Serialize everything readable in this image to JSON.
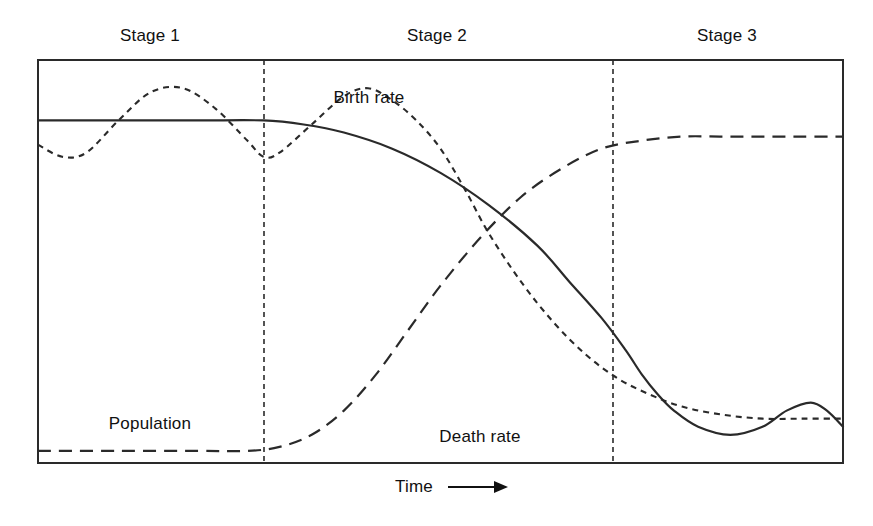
{
  "figure": {
    "background_color": "#ffffff",
    "line_color": "#2a2a2a"
  },
  "stages": [
    {
      "label": "Stage 1",
      "center_x": 150,
      "label_y": 26
    },
    {
      "label": "Stage 2",
      "center_x": 437,
      "label_y": 26
    },
    {
      "label": "Stage 3",
      "center_x": 727,
      "label_y": 26
    }
  ],
  "curve_labels": [
    {
      "name": "birth-rate",
      "label": "Birth rate",
      "x": 369,
      "y": 88
    },
    {
      "name": "population",
      "label": "Population",
      "x": 150,
      "y": 414
    },
    {
      "name": "death-rate",
      "label": "Death rate",
      "x": 480,
      "y": 427
    }
  ],
  "axis": {
    "x_label": "Time",
    "x_label_x": 444,
    "x_label_y": 477,
    "arrow_glyph": "arrow-right"
  },
  "chart_data": {
    "type": "line",
    "xlabel": "Time",
    "ylabel": "",
    "grid": false,
    "legend": "inline-annotations",
    "axis_ranges": {
      "x": [
        0,
        100
      ],
      "y": [
        0,
        100
      ]
    },
    "plot_box_px": {
      "left": 38,
      "top": 60,
      "right": 843,
      "bottom": 463
    },
    "stage_dividers_x": [
      264,
      613
    ],
    "annotations": [
      "Death rate fluctuates widely around a high birth rate in Stage 1",
      "Death rate falls sharply at the start of Stage 2 while birth rate stays high",
      "Population grows rapidly through Stage 2 as the gap between birth and death rates widens",
      "Birth rate falls steeply late in Stage 2 and converges with the death rate at Stage 3",
      "Population levels off in Stage 3 as birth and death rates are both low"
    ],
    "series": [
      {
        "name": "Birth rate",
        "style": "solid",
        "points": [
          [
            0,
            85
          ],
          [
            10,
            85
          ],
          [
            20,
            85
          ],
          [
            28,
            85
          ],
          [
            33,
            84
          ],
          [
            38,
            82
          ],
          [
            44,
            78
          ],
          [
            50,
            72
          ],
          [
            56,
            64
          ],
          [
            62,
            54
          ],
          [
            66,
            45
          ],
          [
            70,
            36
          ],
          [
            73,
            28
          ],
          [
            75,
            22
          ],
          [
            77,
            17
          ],
          [
            79,
            13
          ],
          [
            82,
            9
          ],
          [
            86,
            7
          ],
          [
            90,
            9
          ],
          [
            93,
            13
          ],
          [
            96,
            15
          ],
          [
            98,
            13
          ],
          [
            100,
            9
          ]
        ]
      },
      {
        "name": "Death rate",
        "style": "short-dash",
        "points": [
          [
            0,
            79
          ],
          [
            3,
            76
          ],
          [
            6,
            77
          ],
          [
            10,
            85
          ],
          [
            14,
            92
          ],
          [
            18,
            93
          ],
          [
            22,
            88
          ],
          [
            26,
            80
          ],
          [
            28,
            76
          ],
          [
            30,
            77
          ],
          [
            34,
            84
          ],
          [
            38,
            91
          ],
          [
            41,
            93
          ],
          [
            44,
            90
          ],
          [
            47,
            85
          ],
          [
            50,
            78
          ],
          [
            53,
            68
          ],
          [
            56,
            57
          ],
          [
            60,
            45
          ],
          [
            64,
            35
          ],
          [
            68,
            27
          ],
          [
            72,
            21
          ],
          [
            76,
            17
          ],
          [
            80,
            14
          ],
          [
            85,
            12
          ],
          [
            90,
            11
          ],
          [
            95,
            11
          ],
          [
            100,
            11
          ]
        ]
      },
      {
        "name": "Population",
        "style": "long-dash",
        "points": [
          [
            0,
            3
          ],
          [
            10,
            3
          ],
          [
            20,
            3
          ],
          [
            26,
            3
          ],
          [
            30,
            4
          ],
          [
            34,
            7
          ],
          [
            38,
            13
          ],
          [
            42,
            22
          ],
          [
            46,
            33
          ],
          [
            50,
            44
          ],
          [
            55,
            56
          ],
          [
            60,
            66
          ],
          [
            65,
            73
          ],
          [
            70,
            78
          ],
          [
            75,
            80
          ],
          [
            80,
            81
          ],
          [
            85,
            81
          ],
          [
            90,
            81
          ],
          [
            95,
            81
          ],
          [
            100,
            81
          ]
        ]
      }
    ]
  }
}
